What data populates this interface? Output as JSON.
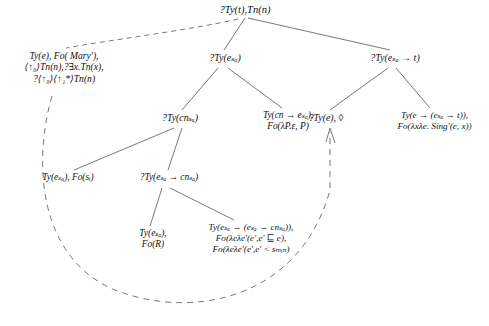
{
  "diagram": {
    "edge_color": "#6a6a6a",
    "text_color": "#111111",
    "nodes": {
      "root": {
        "line1": "?Ty(t),Tn(n)"
      },
      "left": {
        "line1": "Ty(e), Fo( Mary'),",
        "line2": "⟨↑₀⟩Tn(n),?∃x.Tn(x),",
        "line3": "?⟨↑₀⟩⟨↑₁*⟩Tn(n)"
      },
      "mid": {
        "line1": "?Ty(eₛₐ)"
      },
      "right": {
        "line1": "?Ty(eₛₐ → t)"
      },
      "cn": {
        "line1": "?Ty(cnₛₐ)"
      },
      "epsilon": {
        "line1": "Ty(cn → eₛₐ),",
        "line2": "Fo(λP.ε, P)"
      },
      "tye_diamond": {
        "line1": "?Ty(e), ◊"
      },
      "sing": {
        "line1": "Ty(e → (eₛₐ → t)),",
        "line2": "Fo(λxλe. Sing'(e, x))"
      },
      "esa_s": {
        "line1": "Ty(eₛₐ), Fo(sᵢ)"
      },
      "esa_cn": {
        "line1": "?Ty(eₛₐ → cnₛₐ)"
      },
      "for": {
        "line1": "Ty(eₛₐ),",
        "line2": "Fo(R)"
      },
      "big": {
        "line1": "Ty(eₛₐ → (eₛₐ → cnₛₐ)),",
        "line2": "Fo(λeλe'(e',e' ⊑ e),",
        "line3": "Fo(λeλe'(e',e' < sₘᵢₙ)"
      }
    }
  }
}
